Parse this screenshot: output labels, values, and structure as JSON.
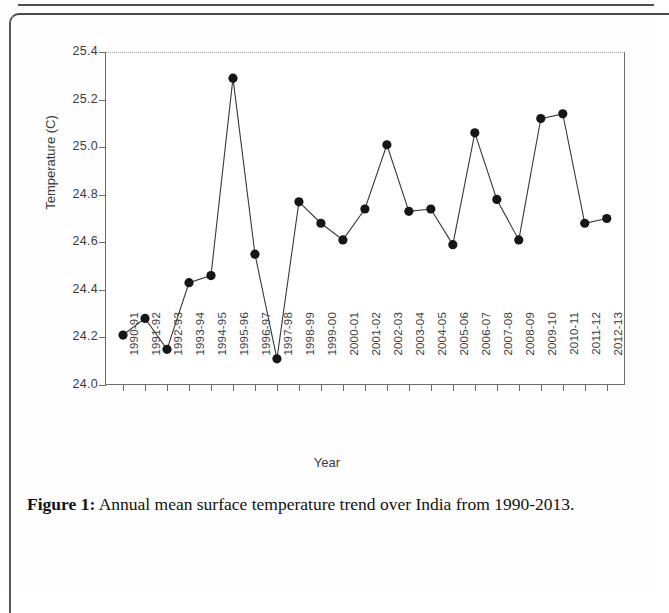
{
  "figure": {
    "caption_label": "Figure 1:",
    "caption_text": " Annual mean surface temperature trend over India from 1990-2013."
  },
  "chart_data": {
    "type": "line",
    "title": "",
    "xlabel": "Year",
    "ylabel": "Temperature (C)",
    "ylim": [
      24.0,
      25.4
    ],
    "ytick_values": [
      24.0,
      24.2,
      24.4,
      24.6,
      24.8,
      25.0,
      25.2,
      25.4
    ],
    "ytick_labels": [
      "24.0",
      "24.2",
      "24.4",
      "24.6",
      "24.8",
      "25.0",
      "25.2",
      "25.4"
    ],
    "grid": false,
    "legend": null,
    "marker": "filled-circle",
    "marker_color": "#161616",
    "line_color": "#3a3a3a",
    "categories": [
      "1990-91",
      "1991-92",
      "1992-93",
      "1993-94",
      "1994-95",
      "1995-96",
      "1996-97",
      "1997-98",
      "1998-99",
      "1999-00",
      "2000-01",
      "2001-02",
      "2002-03",
      "2003-04",
      "2004-05",
      "2005-06",
      "2006-07",
      "2007-08",
      "2008-09",
      "2009-10",
      "2010-11",
      "2011-12",
      "2012-13"
    ],
    "values": [
      24.21,
      24.28,
      24.15,
      24.43,
      24.46,
      25.29,
      24.55,
      24.11,
      24.77,
      24.68,
      24.61,
      24.74,
      25.01,
      24.73,
      24.74,
      24.59,
      25.06,
      24.78,
      24.61,
      25.12,
      25.14,
      24.68,
      24.7
    ]
  }
}
